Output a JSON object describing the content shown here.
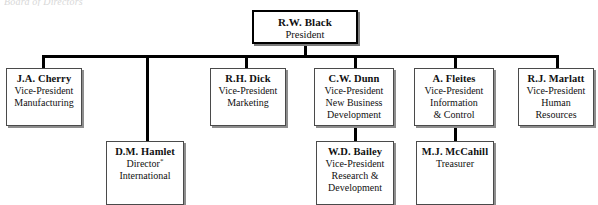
{
  "caption": {
    "text": "Board of Directors"
  },
  "chart_data": {
    "type": "diagram",
    "orientation": "top-down",
    "nodes": [
      {
        "id": "president",
        "name": "R.W. Black",
        "title_lines": [
          "President"
        ],
        "level": 0,
        "x": 252,
        "y": 10,
        "w": 106,
        "h": 34
      },
      {
        "id": "cherry",
        "name": "J.A. Cherry",
        "title_lines": [
          "Vice-President",
          "Manufacturing"
        ],
        "level": 1,
        "x": 6,
        "y": 68,
        "w": 76,
        "h": 58
      },
      {
        "id": "hamlet",
        "name": "D.M. Hamlet",
        "title_lines": [
          "Director*",
          "International"
        ],
        "level": 2,
        "x": 106,
        "y": 141,
        "w": 78,
        "h": 64
      },
      {
        "id": "dick",
        "name": "R.H. Dick",
        "title_lines": [
          "Vice-President",
          "Marketing"
        ],
        "level": 1,
        "x": 210,
        "y": 68,
        "w": 76,
        "h": 58
      },
      {
        "id": "dunn",
        "name": "C.W. Dunn",
        "title_lines": [
          "Vice-President",
          "New Business",
          "Development"
        ],
        "level": 1,
        "x": 314,
        "y": 68,
        "w": 80,
        "h": 58
      },
      {
        "id": "bailey",
        "name": "W.D. Bailey",
        "title_lines": [
          "Vice-President",
          "Research &",
          "Development"
        ],
        "level": 2,
        "x": 316,
        "y": 141,
        "w": 78,
        "h": 64
      },
      {
        "id": "fleites",
        "name": "A. Fleites",
        "title_lines": [
          "Vice-President",
          "Information",
          "& Control"
        ],
        "level": 1,
        "x": 414,
        "y": 68,
        "w": 80,
        "h": 58
      },
      {
        "id": "mccahill",
        "name": "M.J. McCahill",
        "title_lines": [
          "Treasurer"
        ],
        "level": 2,
        "x": 416,
        "y": 141,
        "w": 78,
        "h": 64
      },
      {
        "id": "marlatt",
        "name": "R.J. Marlatt",
        "title_lines": [
          "Vice-President",
          "Human",
          "Resources"
        ],
        "level": 1,
        "x": 518,
        "y": 68,
        "w": 76,
        "h": 58
      }
    ],
    "edges": [
      {
        "from": "president",
        "to": "bus"
      },
      {
        "from": "bus",
        "to": "cherry"
      },
      {
        "from": "bus",
        "to": "hamlet"
      },
      {
        "from": "bus",
        "to": "dick"
      },
      {
        "from": "bus",
        "to": "dunn"
      },
      {
        "from": "bus",
        "to": "fleites"
      },
      {
        "from": "bus",
        "to": "marlatt"
      },
      {
        "from": "dunn",
        "to": "bailey"
      },
      {
        "from": "fleites",
        "to": "mccahill"
      }
    ]
  }
}
